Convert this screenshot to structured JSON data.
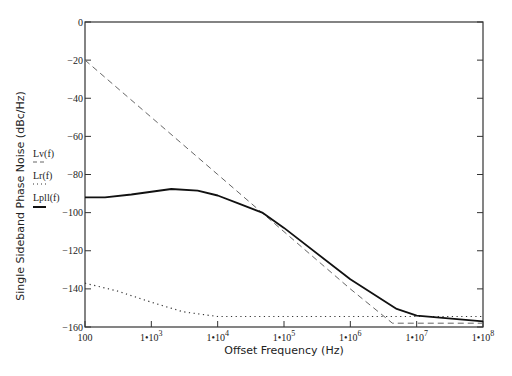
{
  "chart_data": {
    "type": "line",
    "title": "",
    "xlabel": "Offset Frequency (Hz)",
    "ylabel": "Single Sideband Phase Noise (dBc/Hz)",
    "xscale": "log",
    "xlim": [
      100,
      100000000
    ],
    "ylim": [
      -160,
      0
    ],
    "grid": false,
    "legend_position": "left, beside y-axis",
    "x_ticks": [
      {
        "value": 100,
        "label": "100"
      },
      {
        "value": 1000,
        "label": "1•10",
        "exp": "3"
      },
      {
        "value": 10000,
        "label": "1•10",
        "exp": "4"
      },
      {
        "value": 100000,
        "label": "1•10",
        "exp": "5"
      },
      {
        "value": 1000000,
        "label": "1•10",
        "exp": "6"
      },
      {
        "value": 10000000,
        "label": "1•10",
        "exp": "7"
      },
      {
        "value": 100000000,
        "label": "1•10",
        "exp": "8"
      }
    ],
    "y_ticks": [
      0,
      -20,
      -40,
      -60,
      -80,
      -100,
      -120,
      -140,
      -160
    ],
    "series": [
      {
        "name": "Lv(f)",
        "style": "dashed",
        "color": "#666666",
        "x": [
          100,
          1000,
          10000,
          100000,
          1000000,
          4300000,
          10000000,
          100000000
        ],
        "values": [
          -20,
          -50,
          -80,
          -110,
          -140,
          -158,
          -158,
          -158
        ]
      },
      {
        "name": "Lr(f)",
        "style": "dotted",
        "color": "#333333",
        "x": [
          100,
          300,
          1000,
          3000,
          10000,
          100000,
          1000000,
          10000000,
          100000000
        ],
        "values": [
          -137,
          -141,
          -147,
          -152,
          -154.5,
          -154.5,
          -154.5,
          -154.5,
          -154.5
        ]
      },
      {
        "name": "Lpll(f)",
        "style": "solid",
        "color": "#111111",
        "x": [
          100,
          200,
          500,
          2000,
          5000,
          10000,
          20000,
          47000,
          100000,
          1000000,
          5000000,
          10000000,
          100000000
        ],
        "values": [
          -92,
          -92,
          -90.5,
          -87.6,
          -88.5,
          -91,
          -95,
          -100,
          -108,
          -135,
          -150.5,
          -154,
          -157
        ]
      }
    ]
  },
  "axes": {
    "ylabel": "Single Sideband Phase Noise (dBc/Hz)",
    "xlabel": "Offset Frequency (Hz)"
  },
  "legend": {
    "lv": "Lv(f)",
    "lr": "Lr(f)",
    "lpll": "Lpll(f)"
  }
}
